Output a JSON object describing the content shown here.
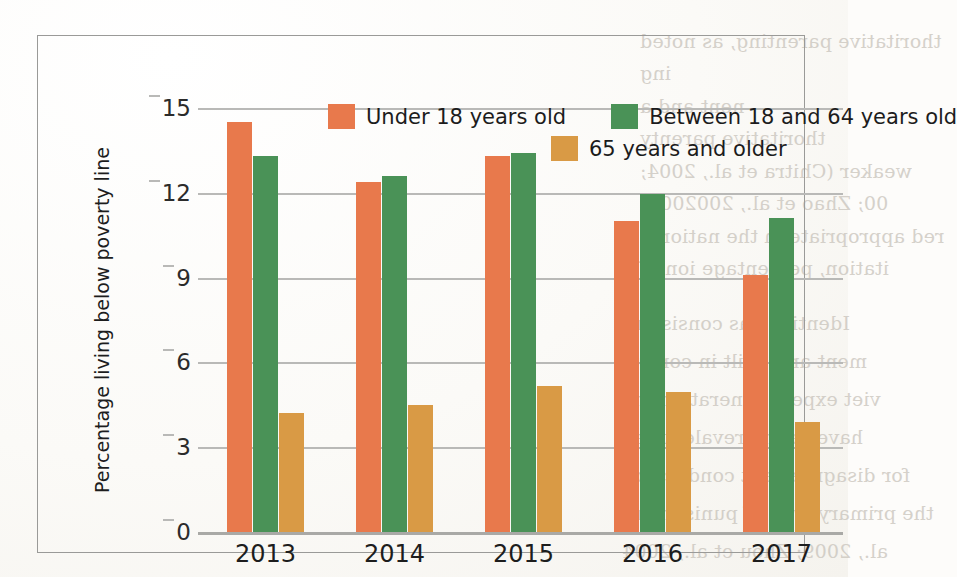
{
  "chart_data": {
    "type": "bar",
    "title": "",
    "xlabel": "",
    "ylabel": "Percentage living below poverty line",
    "categories": [
      "2013",
      "2014",
      "2015",
      "2016",
      "2017"
    ],
    "yticks": [
      0,
      3,
      6,
      9,
      12,
      15
    ],
    "ylim": [
      0,
      15
    ],
    "grid": true,
    "legend_position": "top-center",
    "series": [
      {
        "name": "Under 18 years old",
        "color": "#e8794c",
        "values": [
          14.5,
          12.4,
          13.3,
          11.0,
          9.1
        ]
      },
      {
        "name": "Between 18 and 64 years old",
        "color": "#4a9257",
        "values": [
          13.3,
          12.6,
          13.4,
          11.95,
          11.1
        ]
      },
      {
        "name": "65 years and older",
        "color": "#d99a45",
        "values": [
          4.2,
          4.5,
          5.15,
          4.95,
          3.9
        ]
      }
    ]
  },
  "background_text": {
    "note": "faint mirrored bleed-through text from reverse of scanned book page",
    "lines_top_right": [
      "thoritative parenting, as noted",
      "ing",
      "nent and a",
      "thoritative parenty",
      "weaker (Chitra et al., 2004;",
      "00; Zhao et al., 2002003)",
      "red appropriate in the national",
      "itation, percentage ion of"
    ],
    "lines_bottom_right": [
      "Identity was consistent",
      "ment and guilt in control",
      "viet expect generation the",
      "have been prevalent veh",
      "for disagreement conduct for",
      "the primary type of punishment",
      "al., 2009; Zhou et al., 2004"
    ]
  }
}
